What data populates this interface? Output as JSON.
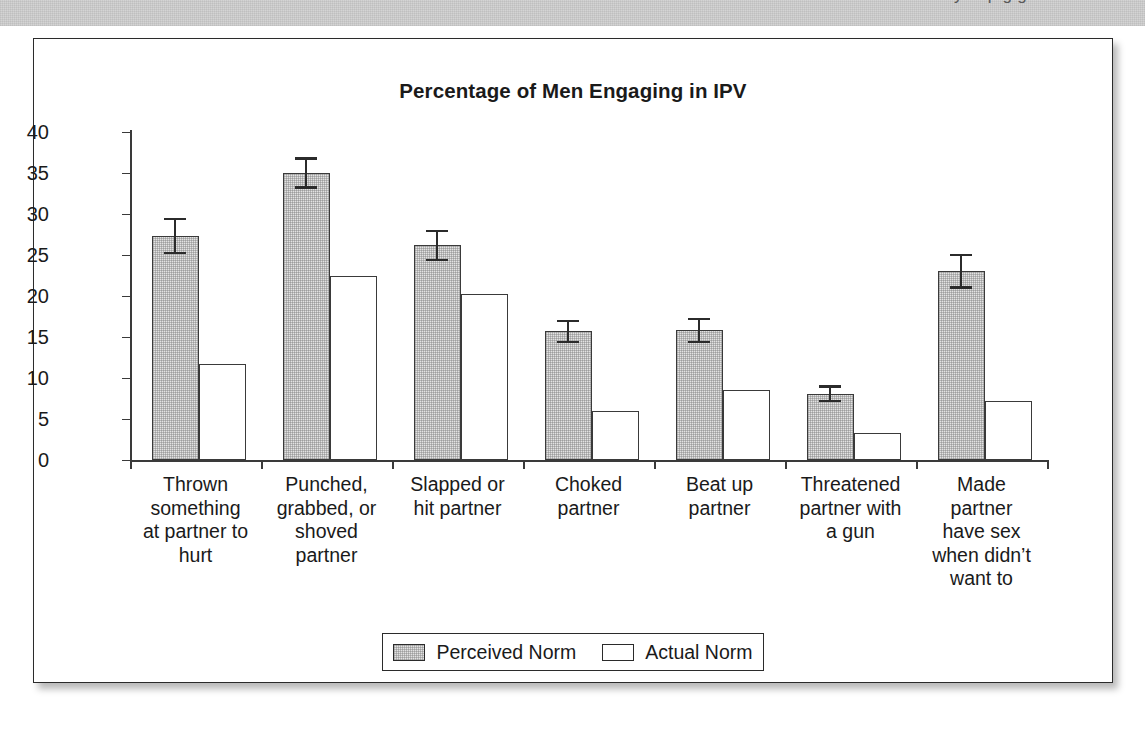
{
  "header": {
    "clipped_text": "y of p g g"
  },
  "legend": {
    "position": "bottom-center",
    "entries": [
      {
        "label": "Perceived Norm",
        "swatch": "gray-filled-square-icon"
      },
      {
        "label": "Actual Norm",
        "swatch": "white-filled-square-icon"
      }
    ]
  },
  "chart_data": {
    "type": "bar",
    "title": "Percentage of Men Engaging in IPV",
    "xlabel": "",
    "ylabel": "",
    "ylim": [
      0,
      40
    ],
    "yticks": [
      0,
      5,
      10,
      15,
      20,
      25,
      30,
      35,
      40
    ],
    "ytick_labels": [
      "0",
      "5",
      "10",
      "15",
      "20",
      "25",
      "30",
      "35",
      "40"
    ],
    "grid": false,
    "categories": [
      "Thrown something at partner to hurt",
      "Punched, grabbed, or shoved partner",
      "Slapped or hit partner",
      "Choked partner",
      "Beat up partner",
      "Threatened partner with a gun",
      "Made partner have sex when didn't want to"
    ],
    "category_lines": [
      [
        "Thrown",
        "something",
        "at partner to",
        "hurt"
      ],
      [
        "Punched,",
        "grabbed, or",
        "shoved",
        "partner"
      ],
      [
        "Slapped or",
        "hit partner"
      ],
      [
        "Choked",
        "partner"
      ],
      [
        "Beat up",
        "partner"
      ],
      [
        "Threatened",
        "partner with",
        "a gun"
      ],
      [
        "Made",
        "partner",
        "have sex",
        "when didn’t",
        "want to"
      ]
    ],
    "series": [
      {
        "name": "Perceived Norm",
        "color": "#e3e3e3",
        "values": [
          27.3,
          35.0,
          26.2,
          15.7,
          15.8,
          8.1,
          23.0
        ],
        "errors": [
          2.2,
          1.9,
          1.9,
          1.4,
          1.5,
          1.0,
          2.1
        ]
      },
      {
        "name": "Actual Norm",
        "color": "#ffffff",
        "values": [
          11.7,
          22.4,
          20.3,
          6.0,
          8.5,
          3.3,
          7.2
        ],
        "errors": [
          0,
          0,
          0,
          0,
          0,
          0,
          0
        ]
      }
    ]
  }
}
